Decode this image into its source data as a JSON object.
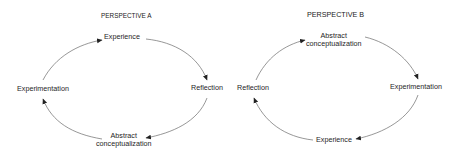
{
  "diagrams": [
    {
      "title": "PERSPECTIVE A",
      "nodes": {
        "top": "Experience",
        "right": "Reflection",
        "bottom_line1": "Abstract",
        "bottom_line2": "conceptualization",
        "left": "Experimentation"
      },
      "cycle_order": [
        "Experience",
        "Reflection",
        "Abstract conceptualization",
        "Experimentation"
      ],
      "direction": "clockwise"
    },
    {
      "title": "PERSPECTIVE B",
      "nodes": {
        "top_line1": "Abstract",
        "top_line2": "conceptualization",
        "right": "Experimentation",
        "bottom": "Experience",
        "left": "Reflection"
      },
      "cycle_order": [
        "Abstract conceptualization",
        "Experimentation",
        "Experience",
        "Reflection"
      ],
      "direction": "clockwise"
    }
  ],
  "colors": {
    "line": "#555555",
    "text": "#1e1e1e",
    "background": "#ffffff"
  }
}
